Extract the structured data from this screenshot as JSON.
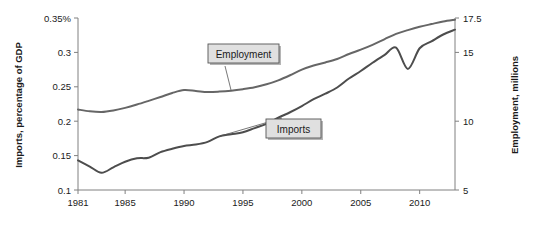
{
  "chart_data": {
    "type": "line",
    "title": "",
    "xlabel": "",
    "ylabel": "Imports, percentage of GDP",
    "ylabel_right": "Employment, millions",
    "x": [
      1981,
      1982,
      1983,
      1984,
      1985,
      1986,
      1987,
      1988,
      1989,
      1990,
      1991,
      1992,
      1993,
      1994,
      1995,
      1996,
      1997,
      1998,
      1999,
      2000,
      2001,
      2002,
      2003,
      2004,
      2005,
      2006,
      2007,
      2008,
      2009,
      2010,
      2011,
      2012,
      2013
    ],
    "xlim": [
      1981,
      2013
    ],
    "xticks": [
      1981,
      1985,
      1990,
      1995,
      2000,
      2005,
      2010
    ],
    "xticklabels": [
      "1981",
      "1985",
      "1990",
      "1995",
      "2000",
      "2005",
      "2010"
    ],
    "ylim": [
      0.1,
      0.35
    ],
    "yticks": [
      0.1,
      0.15,
      0.2,
      0.25,
      0.3,
      0.35
    ],
    "yticklabels": [
      "0.1",
      "0.15",
      "0.2",
      "0.25",
      "0.3",
      "0.35%"
    ],
    "ylim_right": [
      5,
      17.5
    ],
    "yticks_right": [
      5,
      10,
      15,
      17.5
    ],
    "yticklabels_right": [
      "5",
      "10",
      "15",
      "17.5"
    ],
    "grid": false,
    "legend_position": "inline-callout",
    "series": [
      {
        "name": "Imports",
        "axis": "left",
        "units": "percentage of GDP",
        "color": "#4d4d4d",
        "values": [
          0.143,
          0.134,
          0.125,
          0.133,
          0.141,
          0.146,
          0.147,
          0.155,
          0.16,
          0.164,
          0.166,
          0.17,
          0.178,
          0.181,
          0.184,
          0.19,
          0.196,
          0.205,
          0.213,
          0.222,
          0.232,
          0.24,
          0.249,
          0.262,
          0.273,
          0.285,
          0.296,
          0.307,
          0.276,
          0.306,
          0.316,
          0.326,
          0.333
        ]
      },
      {
        "name": "Employment",
        "axis": "right",
        "units": "millions",
        "color": "#666666",
        "values": [
          10.85,
          10.72,
          10.67,
          10.78,
          10.97,
          11.21,
          11.48,
          11.76,
          12.05,
          12.26,
          12.2,
          12.12,
          12.15,
          12.22,
          12.33,
          12.47,
          12.68,
          12.97,
          13.34,
          13.75,
          14.05,
          14.27,
          14.52,
          14.88,
          15.2,
          15.55,
          15.95,
          16.35,
          16.62,
          16.86,
          17.06,
          17.25,
          17.38
        ]
      }
    ],
    "annotations": [
      {
        "label": "Employment",
        "series": "Employment",
        "points_to_year": 1994
      },
      {
        "label": "Imports",
        "series": "Imports",
        "points_to_year": 1993
      }
    ]
  },
  "callouts": {
    "employment": "Employment",
    "imports": "Imports"
  },
  "axes": {
    "left_title": "Imports, percentage of GDP",
    "right_title": "Employment, millions"
  },
  "style": {
    "background": "#ffffff",
    "axis_color": "#808080",
    "text_color": "#1a1a1a",
    "imports_color": "#4d4d4d",
    "employment_color": "#666666",
    "callout_fill": "#e0e0e0",
    "callout_border": "#555555",
    "callout_shadow": "#b5b5b5"
  }
}
